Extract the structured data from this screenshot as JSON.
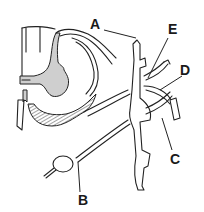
{
  "diagram": {
    "labels": [
      {
        "id": "A",
        "text": "A",
        "x": 97,
        "y": 29
      },
      {
        "id": "B",
        "text": "B",
        "x": 84,
        "y": 205
      },
      {
        "id": "C",
        "text": "C",
        "x": 176,
        "y": 163
      },
      {
        "id": "D",
        "text": "D",
        "x": 186,
        "y": 74
      },
      {
        "id": "E",
        "text": "E",
        "x": 172,
        "y": 34
      }
    ],
    "colors": {
      "background": "#ffffff",
      "line": "#222222",
      "grey_matter": "#cfcfcf",
      "hatch": "#444444"
    }
  }
}
